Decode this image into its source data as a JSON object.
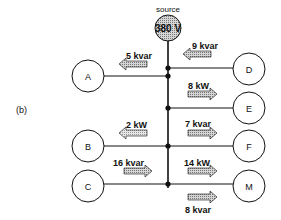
{
  "figure_label": "(b)",
  "source": {
    "label": "source",
    "voltage": "380 V"
  },
  "loads": {
    "A": {
      "name": "A",
      "flow": "5 kvar",
      "direction": "left"
    },
    "B": {
      "name": "B",
      "flow": "2 kW",
      "direction": "left"
    },
    "C": {
      "name": "C",
      "flow": "16 kvar",
      "direction": "right"
    },
    "D": {
      "name": "D",
      "flow": "9 kvar",
      "direction": "left"
    },
    "E": {
      "name": "E",
      "flow": "8 kW",
      "direction": "right"
    },
    "F": {
      "name": "F",
      "flow": "7 kvar",
      "direction": "right"
    },
    "M": {
      "name": "M",
      "flow_top": "14 kW",
      "flow_bottom": "8 kvar",
      "direction": "right"
    }
  },
  "colors": {
    "line": "#111111",
    "arrow_fill": "#bdbdbd",
    "source_fill": "#a8a8a8"
  }
}
